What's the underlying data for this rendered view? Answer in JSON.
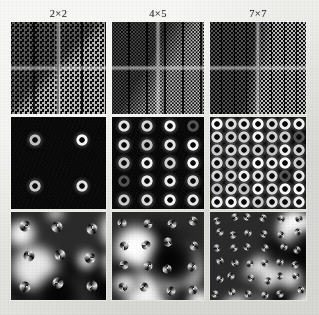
{
  "figure": {
    "kind": "scientific-figure-grid",
    "background_color": "#e9e9e6",
    "columns": 3,
    "rows": 3,
    "column_headers": [
      {
        "label": "2×2",
        "array_x": 2,
        "array_y": 2,
        "spot_count": 4
      },
      {
        "label": "4×5",
        "array_x": 4,
        "array_y": 5,
        "spot_count": 20
      },
      {
        "label": "7×7",
        "array_x": 7,
        "array_y": 7,
        "spot_count": 49
      }
    ],
    "row_descriptions": [
      "near-field intensity lattice (checkerboard tiling with bright cross)",
      "far-field diffraction pattern (array of bright ring-shaped spots on dark background)",
      "phase map with spiral optical-vortex singularities"
    ],
    "panels": [
      {
        "row": 1,
        "column": 1,
        "name": "near-field-2x2",
        "colormap": "gray"
      },
      {
        "row": 1,
        "column": 2,
        "name": "near-field-4x5",
        "colormap": "gray"
      },
      {
        "row": 1,
        "column": 3,
        "name": "near-field-7x7",
        "colormap": "gray"
      },
      {
        "row": 2,
        "column": 1,
        "name": "far-field-2x2",
        "colormap": "gray",
        "spots": "2 × 2"
      },
      {
        "row": 2,
        "column": 2,
        "name": "far-field-4x5",
        "colormap": "gray",
        "spots": "4 × 5"
      },
      {
        "row": 2,
        "column": 3,
        "name": "far-field-7x7",
        "colormap": "gray",
        "spots": "7 × 7"
      },
      {
        "row": 3,
        "column": 1,
        "name": "phase-map-2x2",
        "colormap": "gray"
      },
      {
        "row": 3,
        "column": 2,
        "name": "phase-map-4x5",
        "colormap": "gray"
      },
      {
        "row": 3,
        "column": 3,
        "name": "phase-map-7x7",
        "colormap": "gray"
      }
    ]
  },
  "chart_data": {
    "type": "heatmap",
    "title": "",
    "xlabel": "",
    "ylabel": "",
    "grid": false,
    "legend": "none",
    "categories": [
      "2×2",
      "4×5",
      "7×7"
    ],
    "series": [
      {
        "name": "near-field intensity lattice",
        "values": [
          4,
          20,
          49
        ]
      },
      {
        "name": "far-field diffraction spots",
        "values": [
          4,
          20,
          49
        ]
      },
      {
        "name": "phase vortex singularities",
        "values": [
          4,
          20,
          49
        ]
      }
    ]
  }
}
